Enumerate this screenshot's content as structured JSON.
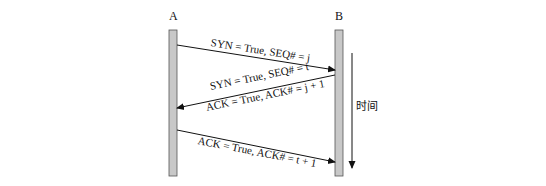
{
  "diagram": {
    "type": "sequence",
    "hosts": [
      {
        "id": "A",
        "label": "A"
      },
      {
        "id": "B",
        "label": "B"
      }
    ],
    "time_axis": {
      "label": "时间"
    },
    "messages": [
      {
        "from": "A",
        "to": "B",
        "labels": [
          "SYN = True, SEQ# = j"
        ]
      },
      {
        "from": "B",
        "to": "A",
        "labels": [
          "SYN = True, SEQ# = t",
          "ACK = True, ACK# = j + 1"
        ]
      },
      {
        "from": "A",
        "to": "B",
        "labels": [
          "ACK = True, ACK# = t + 1"
        ]
      }
    ],
    "colors": {
      "bar_fill": "#c8c8c8",
      "bar_stroke": "#555555",
      "line": "#111111",
      "background_text": "#e4e4e4"
    }
  }
}
